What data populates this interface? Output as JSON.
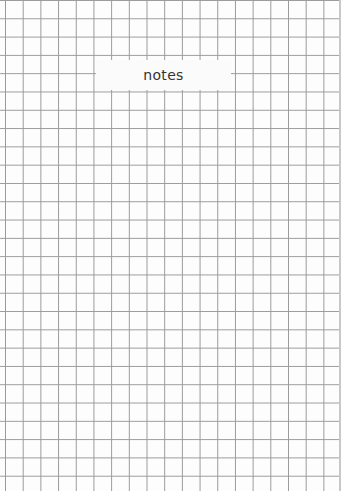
{
  "notebook": {
    "label": "notes",
    "grid_color": "#9a9a9a",
    "background_color": "#fdfdfd"
  }
}
